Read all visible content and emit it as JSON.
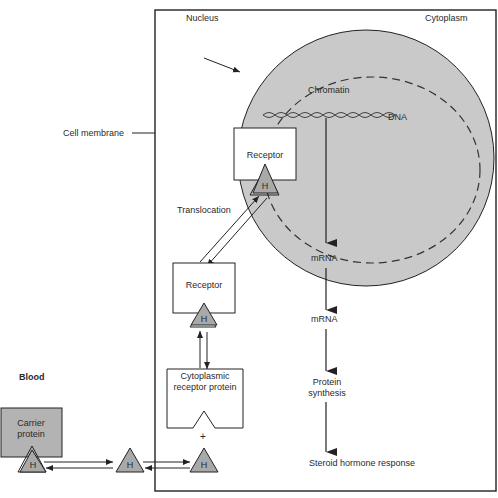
{
  "diagram": {
    "type": "cell signaling pathway",
    "labels": {
      "nucleus": "Nucleus",
      "cytoplasm": "Cytoplasm",
      "chromatin": "Chromatin",
      "dna": "DNA",
      "cell_membrane": "Cell membrane",
      "receptor_nuclear": "Receptor",
      "translocation": "Translocation",
      "mrna_nuclear": "mRNA",
      "receptor_cytoplasmic": "Receptor",
      "mrna_cytoplasm": "mRNA",
      "blood": "Blood",
      "carrier_protein": "Carrier protein",
      "cytoplasmic_receptor_protein": "Cytoplasmic receptor protein",
      "plus": "+",
      "protein_synthesis": "Protein synthesis",
      "steroid_response": "Steroid hormone response",
      "hormone": "H"
    },
    "colors": {
      "nucleus_fill": "#c9c9c9",
      "carrier_fill": "#b3b3b3",
      "hormone_fill": "#a9a9a9",
      "line": "#222222"
    }
  }
}
